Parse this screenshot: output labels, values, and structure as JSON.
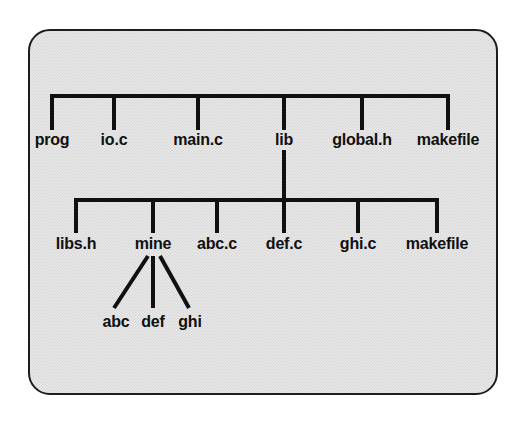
{
  "diagram": {
    "type": "tree",
    "panel": {
      "border_color": "#1d1d1d",
      "fill_color": "#e9e9e9",
      "pattern": "dithered-gray"
    },
    "line_color": "#101010",
    "background_color": "#ffffff",
    "levels": [
      {
        "name": "level-1",
        "bar": {
          "y": 96,
          "x_start": 52,
          "x_end": 448
        },
        "stem_bottom": 130,
        "nodes": [
          {
            "id": "prog",
            "label": "prog",
            "x": 52,
            "type": "directory"
          },
          {
            "id": "io-c",
            "label": "io.c",
            "x": 114,
            "type": "file"
          },
          {
            "id": "main-c",
            "label": "main.c",
            "x": 198,
            "type": "file"
          },
          {
            "id": "lib",
            "label": "lib",
            "x": 284,
            "type": "directory"
          },
          {
            "id": "global-h",
            "label": "global.h",
            "x": 362,
            "type": "file"
          },
          {
            "id": "makefile",
            "label": "makefile",
            "x": 448,
            "type": "file"
          }
        ]
      },
      {
        "name": "level-2",
        "parent": "lib",
        "connector": {
          "x": 284,
          "y_top": 148,
          "y_bottom": 233
        },
        "bar": {
          "y": 200,
          "x_start": 76,
          "x_end": 437
        },
        "stem_bottom": 233,
        "nodes": [
          {
            "id": "libs-h",
            "label": "libs.h",
            "x": 76,
            "type": "file"
          },
          {
            "id": "mine",
            "label": "mine",
            "x": 153,
            "type": "directory"
          },
          {
            "id": "abc-c",
            "label": "abc.c",
            "x": 217,
            "type": "file"
          },
          {
            "id": "def-c",
            "label": "def.c",
            "x": 284,
            "type": "file"
          },
          {
            "id": "ghi-c",
            "label": "ghi.c",
            "x": 358,
            "type": "file"
          },
          {
            "id": "makefile-2",
            "label": "makefile",
            "x": 437,
            "type": "file"
          }
        ]
      },
      {
        "name": "level-3",
        "parent": "mine",
        "fan_origin": {
          "x": 153,
          "y": 256
        },
        "nodes": [
          {
            "id": "abc",
            "label": "abc",
            "x": 116,
            "leg_top_x": 148,
            "leg_bottom_x": 114,
            "type": "file"
          },
          {
            "id": "def",
            "label": "def",
            "x": 153,
            "leg_top_x": 153,
            "leg_bottom_x": 153,
            "type": "file"
          },
          {
            "id": "ghi",
            "label": "ghi",
            "x": 190,
            "leg_top_x": 160,
            "leg_bottom_x": 189,
            "type": "file"
          }
        ],
        "leg_top_y": 256,
        "leg_bottom_y": 308
      }
    ]
  }
}
